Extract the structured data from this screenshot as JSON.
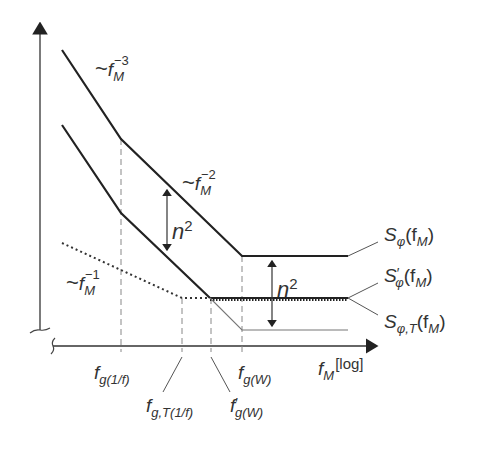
{
  "diagram": {
    "type": "log-log phase noise spectrum sketch",
    "x_axis": {
      "label_var": "f",
      "label_sub": "M",
      "label_unit": "[log]"
    },
    "slopes": [
      {
        "id": "slope-minus3",
        "tilde": "~",
        "var": "f",
        "sub": "M",
        "exp": "−3"
      },
      {
        "id": "slope-minus2",
        "tilde": "~",
        "var": "f",
        "sub": "M",
        "exp": "−2"
      },
      {
        "id": "slope-minus1",
        "tilde": "~",
        "var": "f",
        "sub": "M",
        "exp": "−1"
      }
    ],
    "gap_labels": [
      {
        "id": "n2-left",
        "base": "n",
        "exp": "2"
      },
      {
        "id": "n2-right",
        "base": "n",
        "exp": "2"
      }
    ],
    "curves": [
      {
        "id": "S-phi",
        "name": "S",
        "sub": "φ",
        "prime": "",
        "arg": "(f",
        "arg_sub": "M",
        "close": ")",
        "style": "solid-thick"
      },
      {
        "id": "S-phi-prime",
        "name": "S",
        "sub": "φ",
        "prime": "′",
        "arg": "(f",
        "arg_sub": "M",
        "close": ")",
        "style": "thick-dotted"
      },
      {
        "id": "S-phi-T",
        "name": "S",
        "sub": "φ,T",
        "prime": "",
        "arg": "(f",
        "arg_sub": "M",
        "close": ")",
        "style": "thin"
      }
    ],
    "frequency_markers": [
      {
        "id": "fg-1f",
        "var": "f",
        "prime": "",
        "sub": "g(1/f)"
      },
      {
        "id": "fg-T-1f",
        "var": "f",
        "prime": "",
        "sub": "g,T(1/f)"
      },
      {
        "id": "fg-W-prime",
        "var": "f",
        "prime": "′",
        "sub": "g(W)"
      },
      {
        "id": "fg-W",
        "var": "f",
        "prime": "",
        "sub": "g(W)"
      }
    ],
    "colors": {
      "line": "#2b2b2b",
      "thin": "#6a6a6a",
      "dashed": "#8a8a8a",
      "text": "#333333"
    }
  }
}
